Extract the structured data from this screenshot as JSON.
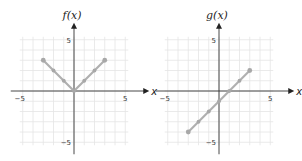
{
  "chart_data": [
    {
      "type": "line",
      "title": "f(x)",
      "xlabel": "x",
      "ylabel": "f(x)",
      "xlim": [
        -5,
        5
      ],
      "ylim": [
        -5,
        5
      ],
      "grid": true,
      "x_ticks": [
        "−5",
        "5"
      ],
      "y_ticks": [
        "5",
        "−5"
      ],
      "series": [
        {
          "name": "f(x)",
          "x": [
            -3,
            -2,
            -1,
            0,
            1,
            2,
            3
          ],
          "y": [
            3,
            2,
            1,
            0,
            1,
            2,
            3
          ]
        }
      ]
    },
    {
      "type": "line",
      "title": "g(x)",
      "xlabel": "x",
      "ylabel": "g(x)",
      "xlim": [
        -5,
        5
      ],
      "ylim": [
        -5,
        5
      ],
      "grid": true,
      "x_ticks": [
        "−5",
        "5"
      ],
      "y_ticks": [
        "5",
        "−5"
      ],
      "series": [
        {
          "name": "g(x)",
          "x": [
            -3,
            -2,
            -1,
            0,
            1,
            2,
            3
          ],
          "y": [
            -4,
            -3,
            -2,
            -1,
            0,
            1,
            2
          ]
        }
      ]
    }
  ],
  "charts": [
    {
      "title": "f(x)",
      "xlabel": "x",
      "tick_neg5": "−5",
      "tick_pos5": "5",
      "ytick_pos5": "5",
      "ytick_neg5": "−5"
    },
    {
      "title": "g(x)",
      "xlabel": "x",
      "tick_neg5": "−5",
      "tick_pos5": "5",
      "ytick_pos5": "5",
      "ytick_neg5": "−5"
    }
  ]
}
